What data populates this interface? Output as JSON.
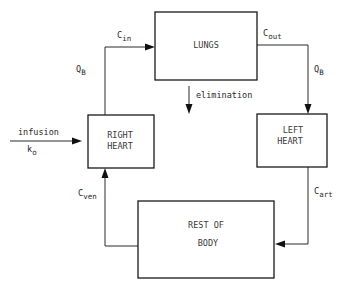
{
  "diagram": {
    "type": "physiological flow diagram (pharmacokinetic model)",
    "boxes": {
      "lungs": {
        "label": "LUNGS"
      },
      "right_heart": {
        "line1": "RIGHT",
        "line2": "HEART"
      },
      "left_heart": {
        "line1": "LEFT",
        "line2": "HEART"
      },
      "rest_of_body": {
        "line1": "REST OF",
        "line2": "BODY"
      }
    },
    "labels": {
      "c_in": {
        "main": "C",
        "sub": "in"
      },
      "c_out": {
        "main": "C",
        "sub": "out"
      },
      "c_art": {
        "main": "C",
        "sub": "art"
      },
      "c_ven": {
        "main": "C",
        "sub": "ven"
      },
      "qb_left": {
        "main": "Q",
        "sub": "B"
      },
      "qb_right": {
        "main": "Q",
        "sub": "B"
      },
      "infusion": "infusion",
      "k0": {
        "main": "k",
        "sub": "o"
      },
      "elimination": "elimination"
    },
    "flows": [
      {
        "from": "infusion",
        "to": "RIGHT HEART",
        "label": "infusion k_o"
      },
      {
        "from": "RIGHT HEART",
        "to": "LUNGS",
        "label": "C_in, Q_B"
      },
      {
        "from": "LUNGS",
        "to": "LEFT HEART",
        "label": "C_out, Q_B"
      },
      {
        "from": "LUNGS",
        "to": "out",
        "label": "elimination"
      },
      {
        "from": "LEFT HEART",
        "to": "REST OF BODY",
        "label": "C_art"
      },
      {
        "from": "REST OF BODY",
        "to": "RIGHT HEART",
        "label": "C_ven"
      }
    ],
    "colors": {
      "ink": "#1a1a1a",
      "background": "#ffffff"
    }
  }
}
